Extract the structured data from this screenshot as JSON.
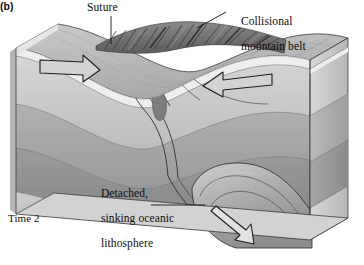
{
  "figure": {
    "panel_label": "(b)",
    "time_label": "Time 2",
    "style": "grayscale-geologic-block-diagram"
  },
  "labels": {
    "suture": "Suture",
    "mountain_belt_line1": "Collisional",
    "mountain_belt_line2": "mountain belt",
    "slab_line1": "Detached,",
    "slab_line2": "sinking oceanic",
    "slab_line3": "lithosphere"
  },
  "annotations": {
    "suture_leader": "vertical-leader-line-down",
    "belt_leader": "diagonal-leader-line-down-left",
    "slab_leader": "horizontal-leader-line-right"
  },
  "arrows": {
    "left_plate": "right-pointing-hollow-arrow",
    "right_plate": "left-pointing-hollow-arrow",
    "slab_sinking": "down-right-pointing-hollow-arrow"
  },
  "colors": {
    "top_surface": "#b9b9b9",
    "crust_band": "#efefef",
    "upper_layer": "#c8c8c8",
    "middle_layer": "#a3a3a3",
    "lower_layer": "#8e8e8e",
    "base_layer": "#bdbdbd",
    "mountain_belt": "#6f6f6f",
    "side_face": "#cfcfcf",
    "outline": "#1a1a1a",
    "background": "#ffffff"
  },
  "features": {
    "mountain_belt": "ridged dark textured uplift at suture",
    "thrust_wedges": "imbricate thrust slices left of suture",
    "plutons": "dark teardrop melt bodies in suture zone",
    "fault_trace": "curved fault descending from suture to detached slab",
    "detached_slab": "rounded sinking lithospheric tongue, lower right"
  }
}
